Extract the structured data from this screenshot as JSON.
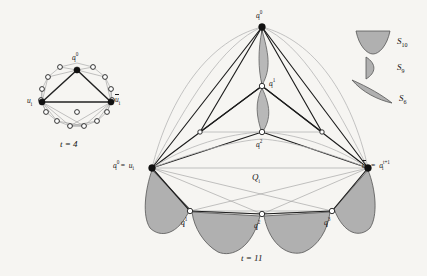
{
  "figure": {
    "background_color": "#f6f5f2",
    "ink_color": "#1d1d1d",
    "shade_fill": "#b9b9b9",
    "light_edge_color": "#bdbdbd",
    "vertex_filled_color": "#111111",
    "vertex_open_color": "#ffffff"
  },
  "left_panel": {
    "name": "small-gadget",
    "caption": "t = 4",
    "caption_t": "t",
    "caption_eq": "= 4",
    "top_vertex_label": "a",
    "top_vertex_sub": "i",
    "top_vertex_sup": "0",
    "left_vertex_label": "u",
    "left_vertex_sub": "i",
    "right_vertex_label": "u",
    "right_vertex_sub": "i",
    "right_vertex_overline": true,
    "filled_vertex_count": 3,
    "open_vertex_count": 13
  },
  "right_panel": {
    "name": "large-gadget",
    "caption": "t = 11",
    "caption_t": "t",
    "caption_eq": "= 11",
    "apex_label_base": "a",
    "apex_label_sub": "i",
    "apex_label_sup": "0",
    "mid1_label_base": "a",
    "mid1_label_sub": "i",
    "mid1_label_sup": "1",
    "mid2_label_base": "a",
    "mid2_label_sub": "i",
    "mid2_label_sup": "2",
    "left_label": "a_i^0 = u_i",
    "left_label_a": "a",
    "left_label_a_sub": "i",
    "left_label_a_sup": "0",
    "left_label_eq": "=",
    "left_label_u": "u",
    "left_label_u_sub": "i",
    "right_label": "u_i = a_i^{t+1}",
    "right_label_u": "u",
    "right_label_u_sub": "i",
    "right_label_eq": "=",
    "right_label_a": "a",
    "right_label_a_sub": "i",
    "right_label_a_sup": "t+1",
    "quad_label_base": "Q",
    "quad_label_sub": "i",
    "bottom_vertices": [
      {
        "base": "q",
        "sub": "i",
        "sup": "1"
      },
      {
        "base": "q",
        "sub": "i",
        "sup": "2"
      },
      {
        "base": "q",
        "sub": "i",
        "sup": "3"
      }
    ]
  },
  "legend": {
    "name": "shape-legend",
    "items": [
      {
        "shape": "funnel-trapezoid",
        "label_base": "S",
        "label_sub": "10"
      },
      {
        "shape": "half-lens-petal",
        "label_base": "S",
        "label_sub": "9"
      },
      {
        "shape": "thin-crescent",
        "label_base": "S",
        "label_sub": "6"
      }
    ]
  }
}
